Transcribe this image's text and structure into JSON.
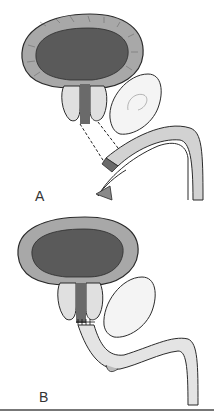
{
  "figure": {
    "panels": [
      {
        "id": "A",
        "label": "A",
        "description": "Bladder, prostate lobes and urethra with dashed lines indicating gap before anastomosis"
      },
      {
        "id": "B",
        "label": "B",
        "description": "Bladder neck anastomosed to urethra with sutures"
      }
    ]
  },
  "colors": {
    "lumen": "#5a5a5a",
    "wall": "#9a9a9a",
    "outline": "#2b2b2b",
    "tissue_light": "#e8e8e8",
    "rule": "#777777"
  }
}
